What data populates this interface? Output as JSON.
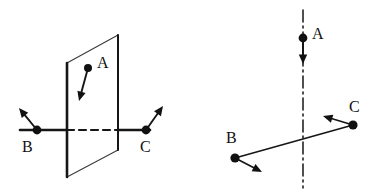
{
  "figure": {
    "width": 377,
    "height": 196,
    "background": "#ffffff",
    "ink_color": "#161616",
    "label_color": "#111111",
    "thin_color": "#3a3a3a"
  },
  "panels": [
    {
      "id": "left-panel",
      "name": "plane-with-three-points-diagram",
      "description": "Vertical plane shown as a parallelogram with a horizontal axis through it; points B and C on the axis and point A on the plane, each with a force arrow.",
      "plane": {
        "name": "inclined-plane-parallelogram",
        "vertices": [
          {
            "x": 67,
            "y": 63
          },
          {
            "x": 118,
            "y": 35
          },
          {
            "x": 118,
            "y": 150
          },
          {
            "x": 67,
            "y": 177
          }
        ]
      },
      "axis": {
        "name": "horizontal-axis-line",
        "x1": 20,
        "y1": 130,
        "x2": 150,
        "y2": 130,
        "hidden_segment": {
          "x1": 67,
          "y1": 130,
          "x2": 118,
          "y2": 130
        }
      },
      "points": [
        {
          "label": "A",
          "name": "point-a",
          "x": 88,
          "y": 68,
          "label_x": 97,
          "label_y": 68,
          "arrow": {
            "to_x": 79,
            "to_y": 101
          }
        },
        {
          "label": "B",
          "name": "point-b",
          "x": 37,
          "y": 130,
          "label_x": 22,
          "label_y": 152,
          "arrow": {
            "to_x": 19,
            "to_y": 108
          }
        },
        {
          "label": "C",
          "name": "point-c",
          "x": 146,
          "y": 130,
          "label_x": 140,
          "label_y": 152,
          "arrow": {
            "to_x": 163,
            "to_y": 106
          }
        }
      ]
    },
    {
      "id": "right-panel",
      "name": "axis-with-three-points-diagram",
      "description": "Vertical dash-dot centerline crossed by a slanted line; point A on the centerline with a downward arrow, points B and C at the ends of the slanted line with arrows.",
      "centerline": {
        "name": "vertical-centerline",
        "x": 303,
        "y1": 10,
        "y2": 188,
        "dash_pattern": "12 4 2 4"
      },
      "slant_line": {
        "name": "slanted-connector-line",
        "x1": 235,
        "y1": 158,
        "x2": 353,
        "y2": 125
      },
      "points": [
        {
          "label": "A",
          "name": "point-a",
          "x": 303,
          "y": 38,
          "label_x": 312,
          "label_y": 39,
          "arrow": {
            "to_x": 303,
            "to_y": 64
          }
        },
        {
          "label": "B",
          "name": "point-b",
          "x": 235,
          "y": 158,
          "label_x": 226,
          "label_y": 143,
          "arrow": {
            "to_x": 262,
            "to_y": 172
          }
        },
        {
          "label": "C",
          "name": "point-c",
          "x": 353,
          "y": 125,
          "label_x": 349,
          "label_y": 112,
          "arrow": {
            "to_x": 323,
            "to_y": 116
          }
        }
      ]
    }
  ]
}
